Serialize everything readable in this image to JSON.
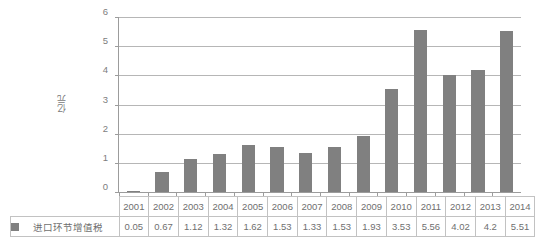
{
  "chart_data": {
    "type": "bar",
    "title": "",
    "xlabel": "",
    "ylabel": "亿元",
    "ylim": [
      0,
      6
    ],
    "yticks": [
      0,
      1,
      2,
      3,
      4,
      5,
      6
    ],
    "grid": true,
    "legend_position": "bottom-table",
    "categories": [
      "2001",
      "2002",
      "2003",
      "2004",
      "2005",
      "2006",
      "2007",
      "2008",
      "2009",
      "2010",
      "2011",
      "2012",
      "2013",
      "2014"
    ],
    "series": [
      {
        "name": "进口环节增值税",
        "color": "#808080",
        "values": [
          0.05,
          0.67,
          1.12,
          1.32,
          1.62,
          1.53,
          1.33,
          1.53,
          1.93,
          3.53,
          5.56,
          4.02,
          4.2,
          5.51
        ],
        "labels": [
          "0.05",
          "0.67",
          "1.12",
          "1.32",
          "1.62",
          "1.53",
          "1.33",
          "1.53",
          "1.93",
          "3.53",
          "5.56",
          "4.02",
          "4.2",
          "5.51"
        ]
      }
    ]
  },
  "legend": {
    "swatch_color": "#808080",
    "label": "进口环节增值税",
    "swatch_icon": "legend-square-icon"
  },
  "colors": {
    "bar": "#808080",
    "gridline": "#b6b6b6",
    "axis": "#9c9c9c",
    "table_border": "#c2c2c2",
    "text": "#6f6f6f",
    "background": "#ffffff"
  }
}
